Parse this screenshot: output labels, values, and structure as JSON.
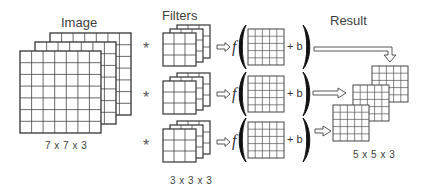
{
  "labels": {
    "image": "Image",
    "filters": "Filters",
    "result": "Result",
    "image_dims": "7 x 7 x 3",
    "filter_dims": "3 x 3 x 3",
    "result_dims": "5 x 5 x 3"
  },
  "operators": {
    "convolve": "*",
    "arrow": "⇨",
    "function": "f",
    "bias": "+ b"
  },
  "diagram": {
    "image_stack": {
      "rows": 7,
      "cols": 7,
      "depth": 3
    },
    "filters": [
      {
        "rows": 3,
        "cols": 3,
        "depth": 3
      },
      {
        "rows": 3,
        "cols": 3,
        "depth": 3
      },
      {
        "rows": 3,
        "cols": 3,
        "depth": 3
      }
    ],
    "activation_grids": [
      {
        "rows": 5,
        "cols": 5
      },
      {
        "rows": 5,
        "cols": 5
      },
      {
        "rows": 5,
        "cols": 5
      }
    ],
    "result_stack": {
      "rows": 5,
      "cols": 5,
      "depth": 3
    },
    "line_color": "#333333"
  }
}
